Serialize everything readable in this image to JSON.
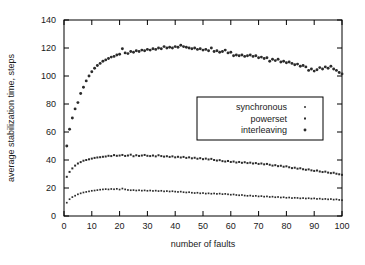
{
  "chart_data": {
    "type": "scatter",
    "title": "",
    "xlabel": "number of faults",
    "ylabel": "average stabilization time, steps",
    "xlim": [
      0,
      100
    ],
    "ylim": [
      0,
      140
    ],
    "xticks": [
      0,
      10,
      20,
      30,
      40,
      50,
      60,
      70,
      80,
      90,
      100
    ],
    "yticks": [
      0,
      20,
      40,
      60,
      80,
      100,
      120,
      140
    ],
    "grid": false,
    "legend_position": "center-right",
    "marker_color": "#2b2b2b",
    "frame_color": "#000000",
    "background": "#ffffff",
    "series": [
      {
        "name": "synchronous",
        "marker": "small-dot",
        "x": [
          1,
          2,
          3,
          4,
          5,
          6,
          7,
          8,
          9,
          10,
          11,
          12,
          13,
          14,
          15,
          16,
          17,
          18,
          19,
          20,
          21,
          22,
          23,
          24,
          25,
          26,
          27,
          28,
          29,
          30,
          31,
          32,
          33,
          34,
          35,
          36,
          37,
          38,
          39,
          40,
          41,
          42,
          43,
          44,
          45,
          46,
          47,
          48,
          49,
          50,
          51,
          52,
          53,
          54,
          55,
          56,
          57,
          58,
          59,
          60,
          61,
          62,
          63,
          64,
          65,
          66,
          67,
          68,
          69,
          70,
          71,
          72,
          73,
          74,
          75,
          76,
          77,
          78,
          79,
          80,
          81,
          82,
          83,
          84,
          85,
          86,
          87,
          88,
          89,
          90,
          91,
          92,
          93,
          94,
          95,
          96,
          97,
          98,
          99,
          100
        ],
        "y": [
          9.5,
          12.0,
          13.5,
          14.5,
          15.5,
          16.2,
          16.8,
          17.2,
          17.6,
          18.0,
          18.2,
          18.5,
          18.8,
          19.0,
          19.2,
          19.0,
          19.3,
          19.1,
          19.4,
          18.9,
          19.6,
          19.0,
          18.6,
          18.4,
          18.5,
          18.2,
          18.4,
          18.1,
          18.3,
          18.0,
          18.2,
          17.9,
          18.1,
          17.8,
          18.0,
          17.6,
          17.8,
          17.5,
          17.7,
          17.4,
          17.2,
          17.4,
          17.0,
          16.8,
          17.0,
          16.6,
          16.4,
          16.6,
          16.2,
          16.4,
          16.0,
          16.2,
          15.9,
          16.1,
          15.8,
          16.0,
          15.6,
          15.8,
          15.5,
          15.2,
          15.4,
          15.0,
          14.8,
          15.0,
          14.6,
          14.4,
          14.6,
          14.2,
          14.4,
          14.0,
          14.2,
          13.8,
          14.0,
          13.6,
          13.8,
          13.4,
          13.6,
          13.2,
          13.4,
          13.0,
          13.2,
          12.8,
          13.0,
          12.9,
          12.6,
          12.8,
          12.5,
          12.7,
          12.4,
          12.6,
          12.2,
          12.4,
          12.0,
          12.2,
          11.9,
          12.1,
          11.7,
          11.9,
          11.5,
          11.3
        ]
      },
      {
        "name": "powerset",
        "marker": "dot",
        "x": [
          1,
          2,
          3,
          4,
          5,
          6,
          7,
          8,
          9,
          10,
          11,
          12,
          13,
          14,
          15,
          16,
          17,
          18,
          19,
          20,
          21,
          22,
          23,
          24,
          25,
          26,
          27,
          28,
          29,
          30,
          31,
          32,
          33,
          34,
          35,
          36,
          37,
          38,
          39,
          40,
          41,
          42,
          43,
          44,
          45,
          46,
          47,
          48,
          49,
          50,
          51,
          52,
          53,
          54,
          55,
          56,
          57,
          58,
          59,
          60,
          61,
          62,
          63,
          64,
          65,
          66,
          67,
          68,
          69,
          70,
          71,
          72,
          73,
          74,
          75,
          76,
          77,
          78,
          79,
          80,
          81,
          82,
          83,
          84,
          85,
          86,
          87,
          88,
          89,
          90,
          91,
          92,
          93,
          94,
          95,
          96,
          97,
          98,
          99,
          100
        ],
        "y": [
          28.0,
          31.5,
          34.0,
          36.0,
          37.5,
          38.5,
          39.5,
          40.0,
          40.5,
          41.0,
          41.5,
          41.8,
          42.0,
          42.3,
          42.5,
          43.0,
          42.8,
          43.5,
          43.0,
          43.2,
          43.6,
          42.9,
          43.2,
          43.8,
          42.7,
          43.4,
          42.9,
          43.2,
          43.6,
          43.0,
          42.8,
          43.2,
          42.6,
          43.4,
          42.8,
          42.4,
          42.7,
          42.2,
          42.6,
          41.9,
          42.3,
          41.8,
          42.2,
          41.5,
          41.9,
          41.2,
          41.6,
          40.9,
          41.3,
          40.6,
          41.0,
          40.4,
          40.8,
          40.0,
          39.6,
          39.9,
          39.2,
          38.9,
          39.3,
          38.6,
          38.9,
          38.2,
          38.6,
          38.0,
          38.4,
          37.8,
          38.1,
          37.5,
          37.8,
          37.2,
          37.5,
          36.9,
          37.2,
          36.6,
          36.0,
          36.3,
          35.6,
          35.9,
          35.2,
          35.5,
          34.8,
          34.2,
          34.5,
          33.8,
          34.1,
          33.4,
          33.0,
          33.3,
          32.6,
          32.2,
          32.5,
          31.8,
          31.4,
          31.7,
          31.0,
          30.6,
          30.9,
          30.2,
          29.8,
          29.4
        ]
      },
      {
        "name": "interleaving",
        "marker": "large-dot",
        "x": [
          1,
          2,
          3,
          4,
          5,
          6,
          7,
          8,
          9,
          10,
          11,
          12,
          13,
          14,
          15,
          16,
          17,
          18,
          19,
          20,
          21,
          22,
          23,
          24,
          25,
          26,
          27,
          28,
          29,
          30,
          31,
          32,
          33,
          34,
          35,
          36,
          37,
          38,
          39,
          40,
          41,
          42,
          43,
          44,
          45,
          46,
          47,
          48,
          49,
          50,
          51,
          52,
          53,
          54,
          55,
          56,
          57,
          58,
          59,
          60,
          61,
          62,
          63,
          64,
          65,
          66,
          67,
          68,
          69,
          70,
          71,
          72,
          73,
          74,
          75,
          76,
          77,
          78,
          79,
          80,
          81,
          82,
          83,
          84,
          85,
          86,
          87,
          88,
          89,
          90,
          91,
          92,
          93,
          94,
          95,
          96,
          97,
          98,
          99,
          100
        ],
        "y": [
          50.0,
          62.0,
          70.0,
          76.5,
          81.0,
          87.5,
          92.0,
          96.5,
          100.0,
          103.0,
          105.5,
          107.5,
          109.0,
          110.5,
          111.5,
          112.5,
          113.5,
          114.0,
          115.0,
          115.5,
          119.5,
          116.5,
          116.0,
          117.5,
          117.0,
          118.0,
          117.5,
          118.5,
          118.0,
          119.0,
          118.5,
          119.5,
          119.0,
          120.0,
          119.5,
          121.0,
          120.0,
          120.5,
          120.0,
          121.0,
          120.5,
          122.0,
          121.0,
          120.5,
          120.0,
          119.5,
          120.0,
          119.0,
          119.5,
          118.5,
          119.0,
          118.0,
          120.0,
          117.5,
          118.0,
          117.0,
          117.5,
          118.5,
          116.5,
          117.0,
          114.5,
          115.0,
          114.5,
          115.0,
          114.0,
          114.5,
          115.0,
          114.0,
          114.5,
          113.0,
          113.5,
          112.5,
          113.0,
          110.5,
          112.0,
          111.0,
          112.0,
          110.0,
          110.5,
          109.5,
          110.0,
          109.0,
          108.0,
          108.5,
          107.0,
          107.5,
          106.5,
          104.0,
          105.0,
          103.5,
          104.5,
          106.0,
          105.0,
          106.5,
          105.5,
          107.0,
          105.0,
          104.0,
          102.5,
          101.5
        ]
      }
    ]
  }
}
